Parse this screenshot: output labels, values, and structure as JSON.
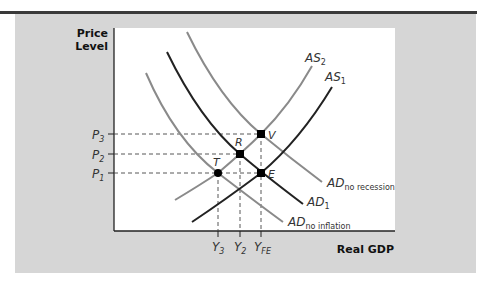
{
  "diagram": {
    "type": "economics-AD-AS",
    "y_axis_title_line1": "Price",
    "y_axis_title_line2": "Level",
    "x_axis_title": "Real GDP",
    "price_levels": [
      {
        "id": "P3",
        "base": "P",
        "sub": "3"
      },
      {
        "id": "P2",
        "base": "P",
        "sub": "2"
      },
      {
        "id": "P1",
        "base": "P",
        "sub": "1"
      }
    ],
    "output_levels": [
      {
        "id": "Y3",
        "base": "Y",
        "sub": "3"
      },
      {
        "id": "Y2",
        "base": "Y",
        "sub": "2"
      },
      {
        "id": "YFE",
        "base": "Y",
        "sub": "FE"
      }
    ],
    "curves": [
      {
        "id": "AS2",
        "base": "AS",
        "sub": "2",
        "color": "#8a8a8a"
      },
      {
        "id": "AS1",
        "base": "AS",
        "sub": "1",
        "color": "#222222"
      },
      {
        "id": "AD_no_recession",
        "base": "AD",
        "sub": "no recession",
        "color": "#8a8a8a"
      },
      {
        "id": "AD1",
        "base": "AD",
        "sub": "1",
        "color": "#222222"
      },
      {
        "id": "AD_no_inflation",
        "base": "AD",
        "sub": "no inflation",
        "color": "#8a8a8a"
      }
    ],
    "points": [
      {
        "id": "V",
        "label": "V"
      },
      {
        "id": "R",
        "label": "R"
      },
      {
        "id": "T",
        "label": "T"
      },
      {
        "id": "E",
        "label": "E"
      }
    ]
  }
}
